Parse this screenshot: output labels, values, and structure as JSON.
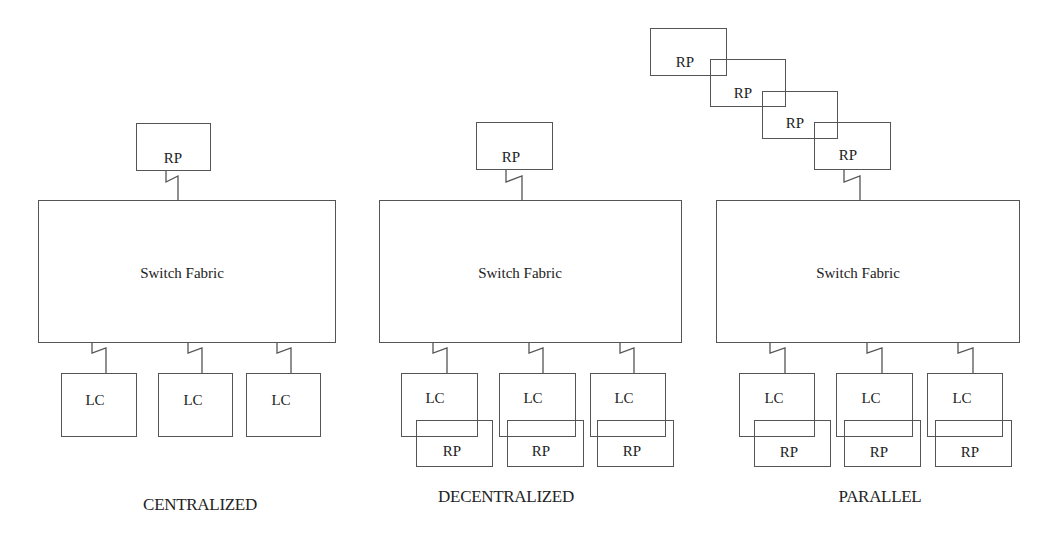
{
  "diagram": {
    "labels": {
      "rp": "RP",
      "lc": "LC",
      "switch_fabric": "Switch Fabric"
    },
    "captions": {
      "centralized": "CENTRALIZED",
      "decentralized": "DECENTRALIZED",
      "parallel": "PARALLEL"
    },
    "architectures": [
      {
        "id": "centralized",
        "route_processors": 1,
        "line_cards": 3,
        "per_card_route_processors": false
      },
      {
        "id": "decentralized",
        "route_processors": 1,
        "line_cards": 3,
        "per_card_route_processors": true
      },
      {
        "id": "parallel",
        "route_processors": 4,
        "line_cards": 3,
        "per_card_route_processors": true
      }
    ]
  }
}
